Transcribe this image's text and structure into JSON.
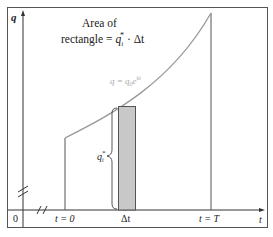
{
  "axes": {
    "y_label": "q",
    "x_label": "t",
    "origin_label": "0"
  },
  "ticks": {
    "t0": "t = 0",
    "dt": "Δt",
    "tT": "t = T"
  },
  "annotation": {
    "line1": "Area of",
    "line2_prefix": "rectangle = ",
    "q_star": "q",
    "q_sub": "i",
    "q_sup": "*",
    "line2_suffix": " · Δt"
  },
  "curve_label": {
    "lhs": "q = q",
    "sub": "0",
    "e": "e",
    "exp": "kt"
  },
  "brace_label": {
    "q": "q",
    "sub": "i",
    "sup": "*"
  },
  "colors": {
    "curve": "#999999",
    "rect_fill": "#c8c8c8",
    "rect_stroke": "#555555",
    "frame": "#444444"
  }
}
